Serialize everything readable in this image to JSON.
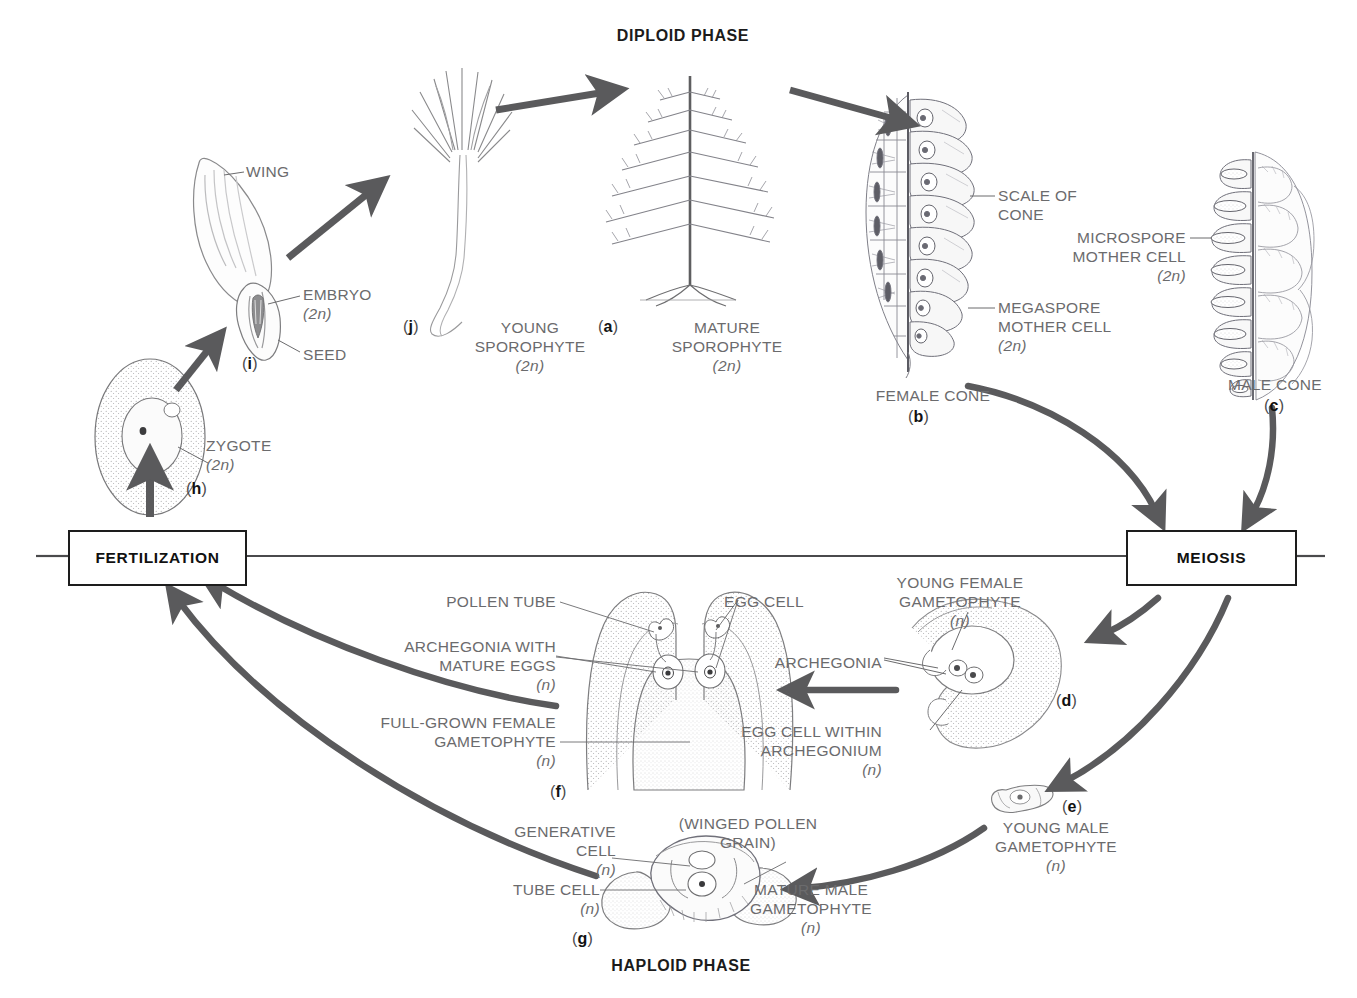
{
  "diagram": {
    "title_top": "DIPLOID PHASE",
    "title_bottom": "HAPLOID PHASE",
    "process_boxes": [
      {
        "id": "fertilization",
        "label": "FERTILIZATION"
      },
      {
        "id": "meiosis",
        "label": "MEIOSIS"
      }
    ],
    "stages": [
      {
        "key": "a",
        "name": "MATURE\nSPOROPHYTE",
        "ploidy": "(2n)"
      },
      {
        "key": "b",
        "name": "FEMALE CONE",
        "ploidy": ""
      },
      {
        "key": "c",
        "name": "MALE CONE",
        "ploidy": ""
      },
      {
        "key": "d",
        "name": "YOUNG FEMALE\nGAMETOPHYTE",
        "ploidy": "(n)"
      },
      {
        "key": "e",
        "name": "YOUNG MALE\nGAMETOPHYTE",
        "ploidy": "(n)"
      },
      {
        "key": "f",
        "name": "FULL-GROWN FEMALE\nGAMETOPHYTE",
        "ploidy": "(n)"
      },
      {
        "key": "g",
        "name": "MATURE MALE\nGAMETOPHYTE",
        "ploidy": "(n)"
      },
      {
        "key": "h",
        "name": "ZYGOTE",
        "ploidy": "(2n)"
      },
      {
        "key": "i",
        "name": "SEED",
        "ploidy": ""
      },
      {
        "key": "j",
        "name": "YOUNG\nSPOROPHYTE",
        "ploidy": "(2n)"
      }
    ],
    "callouts": {
      "wing": "WING",
      "embryo": "EMBRYO",
      "embryo_ploidy": "(2n)",
      "seed": "SEED",
      "zygote": "ZYGOTE",
      "zygote_ploidy": "(2n)",
      "scale_of_cone": "SCALE OF\nCONE",
      "megaspore_mother_cell": "MEGASPORE\nMOTHER CELL",
      "megaspore_ploidy": "(2n)",
      "microspore_mother_cell": "MICROSPORE\nMOTHER CELL",
      "microspore_ploidy": "(2n)",
      "female_cone": "FEMALE CONE",
      "male_cone": "MALE CONE",
      "pollen_tube": "POLLEN TUBE",
      "archegonia_mature_eggs": "ARCHEGONIA WITH\nMATURE EGGS",
      "archegonia_mature_eggs_ploidy": "(n)",
      "full_grown_female_gametophyte": "FULL-GROWN FEMALE\nGAMETOPHYTE",
      "full_grown_female_gametophyte_ploidy": "(n)",
      "egg_cell": "EGG CELL",
      "young_female_gametophyte": "YOUNG FEMALE\nGAMETOPHYTE",
      "young_female_gametophyte_ploidy": "(n)",
      "archegonia": "ARCHEGONIA",
      "egg_cell_within_archegonium": "EGG CELL WITHIN\nARCHEGONIUM",
      "egg_cell_within_archegonium_ploidy": "(n)",
      "young_male_gametophyte": "YOUNG MALE\nGAMETOPHYTE",
      "young_male_gametophyte_ploidy": "(n)",
      "generative_cell": "GENERATIVE\nCELL",
      "generative_cell_ploidy": "(n)",
      "tube_cell": "TUBE CELL",
      "tube_cell_ploidy": "(n)",
      "winged_pollen_grain": "(WINGED POLLEN\nGRAIN)",
      "mature_male_gametophyte": "MATURE MALE\nGAMETOPHYTE",
      "mature_male_gametophyte_ploidy": "(n)",
      "young_sporophyte": "YOUNG\nSPOROPHYTE",
      "young_sporophyte_ploidy": "(2n)",
      "mature_sporophyte": "MATURE\nSPOROPHYTE",
      "mature_sporophyte_ploidy": "(2n)"
    },
    "keys": {
      "a": "(a)",
      "b": "(b)",
      "c": "(c)",
      "d": "(d)",
      "e": "(e)",
      "f": "(f)",
      "g": "(g)",
      "h": "(h)",
      "i": "(i)",
      "j": "(j)"
    },
    "colors": {
      "arrow": "#5a5a5c",
      "ink": "#6b6b6d",
      "bold_ink": "#111111",
      "line": "#4a4a4c",
      "background": "#ffffff"
    }
  }
}
